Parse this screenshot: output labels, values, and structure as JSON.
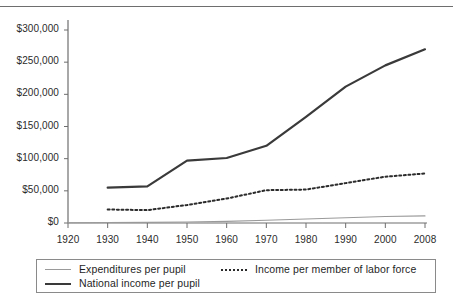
{
  "chart_data": {
    "type": "line",
    "title": "",
    "xlabel": "",
    "ylabel": "",
    "grid": false,
    "legend_position": "bottom",
    "x": [
      1920,
      1930,
      1940,
      1950,
      1960,
      1970,
      1980,
      1990,
      2000,
      2008
    ],
    "xtick_labels": [
      "1920",
      "1930",
      "1940",
      "1950",
      "1960",
      "1970",
      "1980",
      "1990",
      "2000",
      "2008"
    ],
    "ytick_labels": [
      "$0",
      "$50,000",
      "$100,000",
      "$150,000",
      "$200,000",
      "$250,000",
      "$300,000"
    ],
    "ytick_values": [
      0,
      50000,
      100000,
      150000,
      200000,
      250000,
      300000
    ],
    "ylim": [
      0,
      300000
    ],
    "xlim": [
      1920,
      2008
    ],
    "series": [
      {
        "name": "Expenditures per pupil",
        "style": "thin-solid",
        "color": "#9a9a9a",
        "x": [
          1920,
          1930,
          1940,
          1950,
          1960,
          1970,
          1980,
          1990,
          2000,
          2008
        ],
        "values": [
          400,
          700,
          1000,
          1600,
          2600,
          4200,
          6200,
          8200,
          10000,
          11000
        ]
      },
      {
        "name": "Income per member of labor force",
        "style": "dotted",
        "color": "#2b2b2b",
        "x": [
          1930,
          1940,
          1950,
          1960,
          1970,
          1980,
          1990,
          2000,
          2008
        ],
        "values": [
          21000,
          20000,
          28000,
          38000,
          51000,
          52000,
          62000,
          72000,
          77000
        ]
      },
      {
        "name": "National income per pupil",
        "style": "thick-solid",
        "color": "#3a3a3a",
        "x": [
          1930,
          1940,
          1950,
          1960,
          1970,
          1980,
          1990,
          2000,
          2008
        ],
        "values": [
          55000,
          57000,
          97000,
          101000,
          120000,
          165000,
          212000,
          245000,
          270000
        ]
      }
    ]
  },
  "legend": {
    "items": [
      {
        "label": "Expenditures per pupil",
        "swatch": "thin-line-swatch"
      },
      {
        "label": "National income per pupil",
        "swatch": "thick-line-swatch"
      },
      {
        "label": "Income per member of labor force",
        "swatch": "dotted-line-swatch"
      }
    ]
  }
}
